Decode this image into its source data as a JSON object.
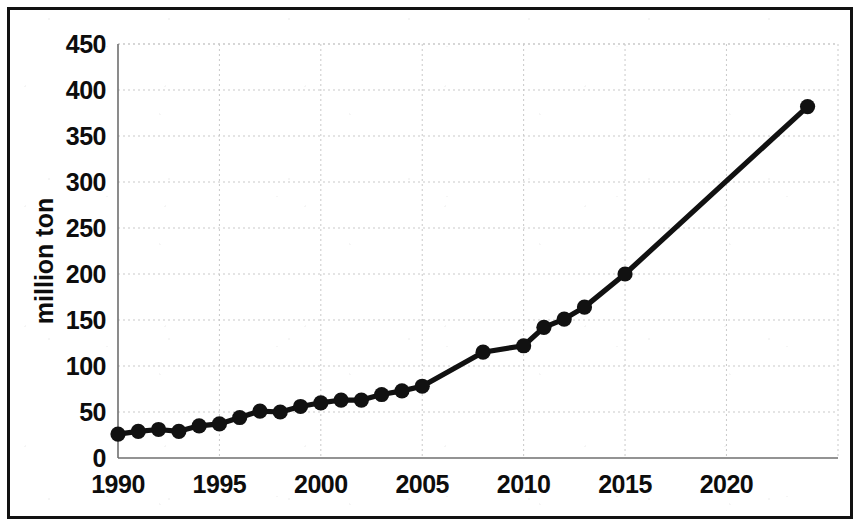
{
  "chart_data": {
    "type": "line",
    "title": "",
    "subtitle": "",
    "xlabel": "",
    "ylabel": "million ton",
    "xlim": [
      1990,
      2025.5
    ],
    "ylim": [
      0,
      450
    ],
    "grid": true,
    "legend": null,
    "x_ticks": [
      1990,
      1995,
      2000,
      2005,
      2010,
      2015,
      2020
    ],
    "x_tick_labels": [
      "1990",
      "1995",
      "2000",
      "2005",
      "2010",
      "2015",
      "2020"
    ],
    "y_ticks": [
      0,
      50,
      100,
      150,
      200,
      250,
      300,
      350,
      400,
      450
    ],
    "y_tick_labels": [
      "0",
      "50",
      "100",
      "150",
      "200",
      "250",
      "300",
      "350",
      "400",
      "450"
    ],
    "marker": "filled-circle",
    "line_color": "#111111",
    "marker_color": "#111111",
    "grid_color": "#c9c9c9",
    "series": [
      {
        "name": "million ton",
        "x": [
          1990,
          1991,
          1992,
          1993,
          1994,
          1995,
          1996,
          1997,
          1998,
          1999,
          2000,
          2001,
          2002,
          2003,
          2004,
          2005,
          2008,
          2010,
          2011,
          2012,
          2013,
          2015,
          2024
        ],
        "values": [
          26,
          29,
          31,
          29,
          35,
          37,
          44,
          51,
          50,
          56,
          60,
          63,
          63,
          69,
          73,
          78,
          115,
          122,
          142,
          151,
          164,
          200,
          382
        ]
      }
    ]
  },
  "axes": {
    "y_axis_name": "million ton",
    "x_axis_name": "year"
  }
}
